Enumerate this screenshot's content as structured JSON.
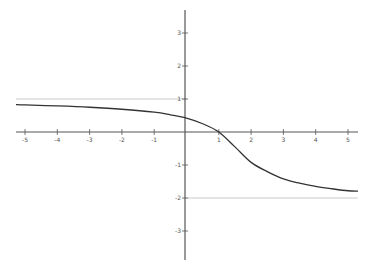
{
  "chart_data": {
    "type": "line",
    "title": "",
    "xlabel": "",
    "ylabel": "",
    "xlim": [
      -5.2,
      5.3
    ],
    "ylim": [
      -3.9,
      3.8
    ],
    "grid": false,
    "legend": null,
    "x_ticks": [
      -5,
      -4,
      -3,
      -2,
      -1,
      1,
      2,
      3,
      4,
      5
    ],
    "x_tick_labels": [
      "-5",
      "-4",
      "-3",
      "-2",
      "-1",
      "1",
      "2",
      "3",
      "4",
      "5"
    ],
    "y_ticks": [
      3,
      2,
      1,
      -1,
      -2,
      -3
    ],
    "y_tick_labels": [
      "3",
      "2",
      "1",
      "-1",
      "-2",
      "-3"
    ],
    "series": [
      {
        "name": "f(x)",
        "color": "#333333",
        "x": [
          -5,
          -4,
          -3,
          -2,
          -1,
          -0.5,
          0,
          0.5,
          1,
          1.5,
          2,
          2.5,
          3,
          3.5,
          4,
          4.5,
          5
        ],
        "values": [
          0.82,
          0.79,
          0.75,
          0.69,
          0.6,
          0.52,
          0.42,
          0.25,
          0,
          -0.45,
          -0.92,
          -1.2,
          -1.42,
          -1.55,
          -1.65,
          -1.72,
          -1.78
        ]
      }
    ],
    "annotations": [
      {
        "type": "hline",
        "y": 1,
        "x_range": [
          -5.3,
          0
        ],
        "label": "horizontal asymptote y=1",
        "color": "#bbbbbb"
      },
      {
        "type": "hline",
        "y": -2,
        "x_range": [
          0,
          5.3
        ],
        "label": "horizontal asymptote y=-2",
        "color": "#bbbbbb"
      }
    ]
  },
  "colors": {
    "axis": "#555555",
    "curve": "#333333",
    "asymptote": "#c0c0c0",
    "background": "#ffffff"
  }
}
